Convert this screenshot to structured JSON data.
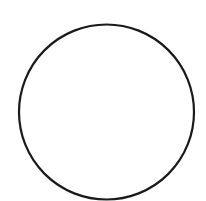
{
  "canvas": {
    "width": 206,
    "height": 201,
    "background": "#ffffff"
  },
  "shapes": [
    {
      "type": "circle",
      "cx": 106.5,
      "cy": 112,
      "r": 87.5,
      "stroke": "#1a1a1a",
      "stroke_width": 2.2,
      "fill": "none"
    }
  ]
}
